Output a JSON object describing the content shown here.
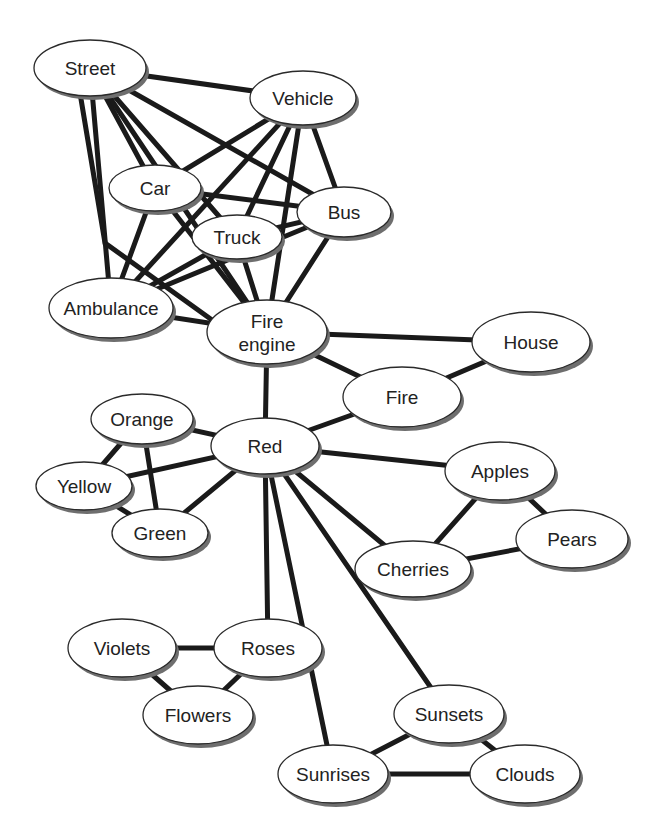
{
  "diagram": {
    "type": "semantic-network",
    "nodes": [
      {
        "id": "street",
        "label": "Street",
        "x": 90,
        "y": 68,
        "rx": 56,
        "ry": 28
      },
      {
        "id": "vehicle",
        "label": "Vehicle",
        "x": 303,
        "y": 98,
        "rx": 53,
        "ry": 27
      },
      {
        "id": "car",
        "label": "Car",
        "x": 155,
        "y": 188,
        "rx": 46,
        "ry": 23
      },
      {
        "id": "bus",
        "label": "Bus",
        "x": 344,
        "y": 212,
        "rx": 47,
        "ry": 25
      },
      {
        "id": "truck",
        "label": "Truck",
        "x": 237,
        "y": 237,
        "rx": 45,
        "ry": 22
      },
      {
        "id": "ambulance",
        "label": "Ambulance",
        "x": 111,
        "y": 308,
        "rx": 62,
        "ry": 30
      },
      {
        "id": "fire_engine",
        "label": "Fire engine",
        "x": 267,
        "y": 332,
        "rx": 60,
        "ry": 32
      },
      {
        "id": "house",
        "label": "House",
        "x": 531,
        "y": 342,
        "rx": 59,
        "ry": 30
      },
      {
        "id": "fire",
        "label": "Fire",
        "x": 402,
        "y": 397,
        "rx": 59,
        "ry": 30
      },
      {
        "id": "orange",
        "label": "Orange",
        "x": 142,
        "y": 419,
        "rx": 51,
        "ry": 25
      },
      {
        "id": "red",
        "label": "Red",
        "x": 265,
        "y": 446,
        "rx": 54,
        "ry": 28
      },
      {
        "id": "yellow",
        "label": "Yellow",
        "x": 84,
        "y": 486,
        "rx": 48,
        "ry": 24
      },
      {
        "id": "apples",
        "label": "Apples",
        "x": 500,
        "y": 471,
        "rx": 55,
        "ry": 29
      },
      {
        "id": "green",
        "label": "Green",
        "x": 160,
        "y": 533,
        "rx": 48,
        "ry": 24
      },
      {
        "id": "pears",
        "label": "Pears",
        "x": 572,
        "y": 539,
        "rx": 56,
        "ry": 29
      },
      {
        "id": "cherries",
        "label": "Cherries",
        "x": 413,
        "y": 569,
        "rx": 58,
        "ry": 28
      },
      {
        "id": "violets",
        "label": "Violets",
        "x": 122,
        "y": 648,
        "rx": 54,
        "ry": 29
      },
      {
        "id": "roses",
        "label": "Roses",
        "x": 268,
        "y": 648,
        "rx": 54,
        "ry": 29
      },
      {
        "id": "flowers",
        "label": "Flowers",
        "x": 198,
        "y": 715,
        "rx": 55,
        "ry": 29
      },
      {
        "id": "sunsets",
        "label": "Sunsets",
        "x": 449,
        "y": 714,
        "rx": 55,
        "ry": 29
      },
      {
        "id": "sunrises",
        "label": "Sunrises",
        "x": 333,
        "y": 774,
        "rx": 55,
        "ry": 29
      },
      {
        "id": "clouds",
        "label": "Clouds",
        "x": 525,
        "y": 774,
        "rx": 55,
        "ry": 29
      }
    ],
    "edges": [
      [
        "street",
        "vehicle"
      ],
      [
        "street",
        "car"
      ],
      [
        "street",
        "bus"
      ],
      [
        "street",
        "truck"
      ],
      [
        "street",
        "ambulance"
      ],
      [
        "street",
        "fire_engine"
      ],
      [
        "street",
        "ambulance_route"
      ],
      [
        "vehicle",
        "car"
      ],
      [
        "vehicle",
        "truck"
      ],
      [
        "vehicle",
        "bus"
      ],
      [
        "vehicle",
        "ambulance"
      ],
      [
        "vehicle",
        "fire_engine"
      ],
      [
        "car",
        "bus"
      ],
      [
        "car",
        "ambulance"
      ],
      [
        "car",
        "fire_engine"
      ],
      [
        "truck",
        "bus"
      ],
      [
        "truck",
        "ambulance"
      ],
      [
        "truck",
        "fire_engine"
      ],
      [
        "bus",
        "ambulance"
      ],
      [
        "bus",
        "fire_engine"
      ],
      [
        "ambulance",
        "fire_engine"
      ],
      [
        "fire_engine",
        "house"
      ],
      [
        "fire_engine",
        "fire"
      ],
      [
        "fire_engine",
        "red"
      ],
      [
        "house",
        "fire"
      ],
      [
        "fire",
        "red"
      ],
      [
        "red",
        "orange"
      ],
      [
        "red",
        "yellow"
      ],
      [
        "red",
        "green"
      ],
      [
        "orange",
        "yellow"
      ],
      [
        "orange",
        "green"
      ],
      [
        "yellow",
        "green"
      ],
      [
        "red",
        "apples"
      ],
      [
        "red",
        "cherries"
      ],
      [
        "apples",
        "cherries"
      ],
      [
        "apples",
        "pears"
      ],
      [
        "cherries",
        "pears"
      ],
      [
        "red",
        "roses"
      ],
      [
        "red",
        "sunrises"
      ],
      [
        "red",
        "sunsets"
      ],
      [
        "violets",
        "roses"
      ],
      [
        "violets",
        "flowers"
      ],
      [
        "roses",
        "flowers"
      ],
      [
        "sunsets",
        "sunrises"
      ],
      [
        "sunsets",
        "clouds"
      ],
      [
        "sunrises",
        "clouds"
      ]
    ]
  }
}
